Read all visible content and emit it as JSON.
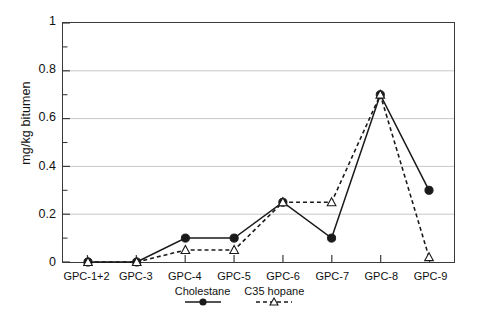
{
  "chart_data": {
    "type": "line",
    "title": "",
    "xlabel": "",
    "ylabel": "mg/kg bitumen",
    "categories": [
      "GPC-1+2",
      "GPC-3",
      "GPC-4",
      "GPC-5",
      "GPC-6",
      "GPC-7",
      "GPC-8",
      "GPC-9"
    ],
    "ylim": [
      0,
      1
    ],
    "yticks": [
      0,
      0.2,
      0.4,
      0.6,
      0.8,
      1
    ],
    "ytick_labels": [
      "0",
      "0.2",
      "0.4",
      "0.6",
      "0.8",
      "1"
    ],
    "minor_yticks": [
      0.1,
      0.3,
      0.5,
      0.7,
      0.9
    ],
    "grid": "horizontal-major",
    "legend_position": "below-axes",
    "series": [
      {
        "name": "Cholestane",
        "values": [
          0,
          0,
          0.1,
          0.1,
          0.25,
          0.1,
          0.7,
          0.3
        ],
        "line_style": "solid",
        "marker": "filled-circle",
        "color": "#1a1a1a"
      },
      {
        "name": "C35 hopane",
        "values": [
          0,
          0,
          0.05,
          0.05,
          0.25,
          0.25,
          0.7,
          0.02
        ],
        "line_style": "dashed",
        "marker": "open-triangle",
        "color": "#1a1a1a"
      }
    ]
  },
  "axes": {
    "frame_color": "#3a3a3a",
    "grid_color": "#c8c8c8"
  }
}
